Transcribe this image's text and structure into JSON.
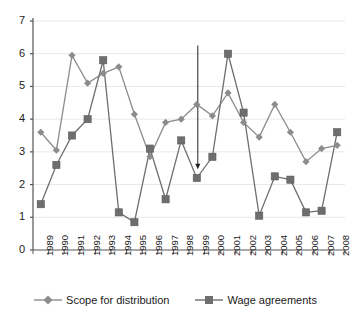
{
  "chart_data": {
    "type": "line",
    "title": "",
    "subtitle": "",
    "xlabel": "",
    "ylabel": "",
    "categories": [
      "1989",
      "1990",
      "1991",
      "1992",
      "1993",
      "1994",
      "1995",
      "1996",
      "1997",
      "1998",
      "1999",
      "2000",
      "2001",
      "2002",
      "2003",
      "2004",
      "2005",
      "2006",
      "2007",
      "2008"
    ],
    "series": [
      {
        "name": "Scope for distribution",
        "marker": "diamond",
        "color": "#8c8c8c",
        "values": [
          3.6,
          3.05,
          5.95,
          5.1,
          5.4,
          5.6,
          4.15,
          2.85,
          3.9,
          4.0,
          4.45,
          4.1,
          4.8,
          3.9,
          3.45,
          4.45,
          3.6,
          2.7,
          3.1,
          3.2
        ]
      },
      {
        "name": "Wage agreements",
        "marker": "square",
        "color": "#6e6e6e",
        "values": [
          1.4,
          2.6,
          3.5,
          4.0,
          5.8,
          1.15,
          0.85,
          3.1,
          1.55,
          3.35,
          2.2,
          2.85,
          6.0,
          4.2,
          1.05,
          2.25,
          2.15,
          1.15,
          1.2,
          3.6
        ]
      }
    ],
    "yticks": [
      0,
      1,
      2,
      3,
      4,
      5,
      6,
      7
    ],
    "ylim": [
      0,
      7
    ],
    "grid": true,
    "legend_position": "bottom",
    "annotations": [
      {
        "type": "arrow",
        "name": "downward-arrow-1999",
        "x_category": "1999",
        "y_start": 6.25,
        "y_end": 2.5
      }
    ]
  },
  "legend": {
    "items": [
      {
        "label": "Scope for distribution"
      },
      {
        "label": "Wage agreements"
      }
    ]
  }
}
